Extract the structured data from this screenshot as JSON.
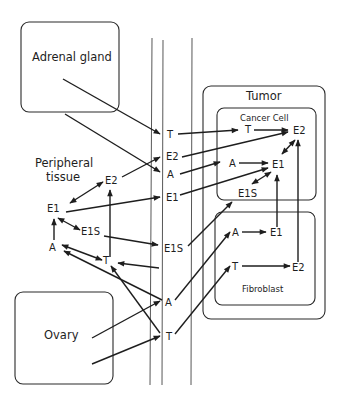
{
  "diagram": {
    "compartments": {
      "adrenal": "Adrenal gland",
      "peripheral_1": "Peripheral",
      "peripheral_2": "tissue",
      "ovary": "Ovary",
      "tumor": "Tumor",
      "cancer_cell": "Cancer Cell",
      "fibroblast": "Fibroblast"
    },
    "circulation_nodes": {
      "t_top": "T",
      "e2": "E2",
      "a_top": "A",
      "e1": "E1",
      "e1s": "E1S",
      "a_bottom": "A",
      "t_bottom": "T"
    },
    "peripheral_nodes": {
      "e2": "E2",
      "e1": "E1",
      "e1s": "E1S",
      "a": "A",
      "t": "T"
    },
    "cancer_cell_nodes": {
      "t": "T",
      "e2": "E2",
      "a": "A",
      "e1": "E1",
      "e1s": "E1S"
    },
    "fibroblast_nodes": {
      "a": "A",
      "e1": "E1",
      "t": "T",
      "e2": "E2"
    },
    "colors": {
      "stroke": "#1e1e1e",
      "background": "#ffffff"
    }
  }
}
